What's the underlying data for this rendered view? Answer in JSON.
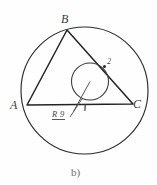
{
  "figure": {
    "caption": "b)",
    "background_color": "#fefefe",
    "stroke_color": "#2b2b2b",
    "label_color": "#3a3a3a",
    "labels": {
      "vertex_b": "B",
      "vertex_a": "A",
      "vertex_c": "C",
      "angle_1": "1",
      "angle_2": "2",
      "radius": "R 9"
    },
    "icons": {
      "circumcircle": "large-circle",
      "incircle": "small-circle",
      "triangle": "inscribed-triangle",
      "radius_leader": "leader-line"
    },
    "geometry": {
      "circumcircle": {
        "cx": 84.5,
        "cy": 90.5,
        "r": 63.5
      },
      "incircle": {
        "cx": 90,
        "cy": 81.5,
        "r": 18.5
      },
      "triangle": {
        "a": {
          "x": 27,
          "y": 105
        },
        "b": {
          "x": 67,
          "y": 30
        },
        "c": {
          "x": 133,
          "y": 104
        }
      },
      "radius_segment": {
        "x1": 90,
        "y1": 81.5,
        "x2": 73,
        "y2": 112
      },
      "leader_line": {
        "x1": 74,
        "y1": 112,
        "x2": 83,
        "y2": 97
      }
    }
  }
}
